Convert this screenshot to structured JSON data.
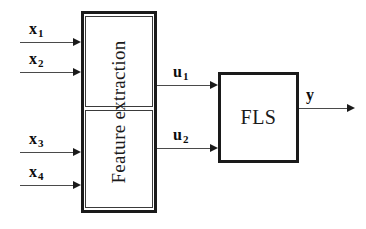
{
  "diagram": {
    "blocks": {
      "feature_extraction": {
        "label": "Feature extraction",
        "orientation": "vertical-rotated",
        "inner_sections": 2
      },
      "fls": {
        "label": "FLS"
      }
    },
    "inputs": [
      {
        "name": "x1",
        "symbol": "x",
        "subscript": "1"
      },
      {
        "name": "x2",
        "symbol": "x",
        "subscript": "2"
      },
      {
        "name": "x3",
        "symbol": "x",
        "subscript": "3"
      },
      {
        "name": "x4",
        "symbol": "x",
        "subscript": "4"
      }
    ],
    "intermediate": [
      {
        "name": "u1",
        "symbol": "u",
        "subscript": "1"
      },
      {
        "name": "u2",
        "symbol": "u",
        "subscript": "2"
      }
    ],
    "output": {
      "name": "y",
      "symbol": "y",
      "subscript": ""
    },
    "colors": {
      "stroke": "#1a1a1a",
      "line": "#4a4a4a",
      "background": "#ffffff"
    }
  }
}
